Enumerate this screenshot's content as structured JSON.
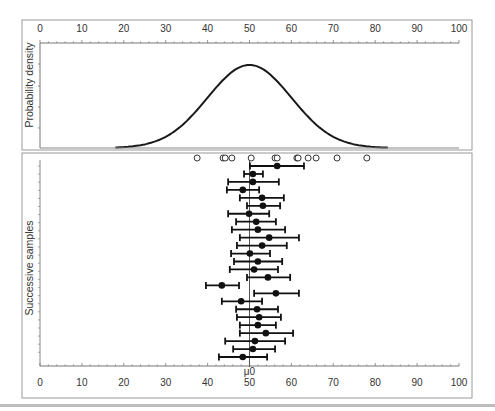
{
  "chart_data": [
    {
      "type": "line",
      "panel": "top",
      "title": "",
      "ylabel": "Probability density",
      "xlabel": "",
      "xlim": [
        0,
        100
      ],
      "x_ticks": [
        0,
        10,
        20,
        30,
        40,
        50,
        60,
        70,
        80,
        90,
        100
      ],
      "x_tick_position": "top",
      "grid": false,
      "distribution": {
        "name": "normal",
        "mean": 50,
        "sd": 10
      },
      "series": [
        {
          "name": "density curve",
          "x": [
            0,
            10,
            20,
            25,
            30,
            35,
            40,
            45,
            50,
            55,
            60,
            65,
            70,
            75,
            80,
            90,
            100
          ],
          "values": [
            0.0,
            0.0,
            0.0004,
            0.0018,
            0.0054,
            0.013,
            0.0242,
            0.0352,
            0.0399,
            0.0352,
            0.0242,
            0.013,
            0.0054,
            0.0018,
            0.0004,
            0.0,
            0.0
          ]
        }
      ]
    },
    {
      "type": "scatter",
      "panel": "bottom",
      "title": "",
      "ylabel": "Successive samples",
      "xlabel": "",
      "xlim": [
        0,
        100
      ],
      "x_ticks": [
        0,
        10,
        20,
        30,
        40,
        50,
        60,
        70,
        80,
        90,
        100
      ],
      "reference_line": {
        "x": 50,
        "label": "μ0"
      },
      "grid": false,
      "legend": "none",
      "single_sample_points": [
        37.5,
        43.7,
        44.2,
        45.8,
        50.4,
        56.1,
        56.6,
        61.3,
        61.6,
        64.0,
        65.9,
        70.9,
        78.0
      ],
      "sample_intervals": [
        {
          "sample": 1,
          "mean": 56.6,
          "lower": 50.1,
          "upper": 63.0
        },
        {
          "sample": 2,
          "mean": 50.8,
          "lower": 48.7,
          "upper": 53.2
        },
        {
          "sample": 3,
          "mean": 50.8,
          "lower": 44.9,
          "upper": 57.0
        },
        {
          "sample": 4,
          "mean": 48.4,
          "lower": 44.6,
          "upper": 52.3
        },
        {
          "sample": 5,
          "mean": 53.0,
          "lower": 47.7,
          "upper": 58.2
        },
        {
          "sample": 6,
          "mean": 53.2,
          "lower": 49.4,
          "upper": 57.3
        },
        {
          "sample": 7,
          "mean": 49.9,
          "lower": 44.9,
          "upper": 54.7
        },
        {
          "sample": 8,
          "mean": 51.6,
          "lower": 46.8,
          "upper": 56.3
        },
        {
          "sample": 9,
          "mean": 52.0,
          "lower": 45.8,
          "upper": 58.5
        },
        {
          "sample": 10,
          "mean": 54.7,
          "lower": 47.7,
          "upper": 61.8
        },
        {
          "sample": 11,
          "mean": 53.0,
          "lower": 47.0,
          "upper": 58.9
        },
        {
          "sample": 12,
          "mean": 50.1,
          "lower": 45.6,
          "upper": 54.9
        },
        {
          "sample": 13,
          "mean": 52.0,
          "lower": 46.3,
          "upper": 57.8
        },
        {
          "sample": 14,
          "mean": 51.1,
          "lower": 45.3,
          "upper": 56.8
        },
        {
          "sample": 15,
          "mean": 54.4,
          "lower": 49.4,
          "upper": 59.7
        },
        {
          "sample": 16,
          "mean": 43.4,
          "lower": 39.6,
          "upper": 47.5
        },
        {
          "sample": 17,
          "mean": 56.3,
          "lower": 51.1,
          "upper": 61.8
        },
        {
          "sample": 18,
          "mean": 48.0,
          "lower": 43.4,
          "upper": 53.0
        },
        {
          "sample": 19,
          "mean": 51.8,
          "lower": 46.8,
          "upper": 56.8
        },
        {
          "sample": 20,
          "mean": 52.3,
          "lower": 47.0,
          "upper": 57.5
        },
        {
          "sample": 21,
          "mean": 52.0,
          "lower": 47.7,
          "upper": 56.3
        },
        {
          "sample": 22,
          "mean": 53.9,
          "lower": 47.7,
          "upper": 60.4
        },
        {
          "sample": 23,
          "mean": 51.3,
          "lower": 44.2,
          "upper": 58.5
        },
        {
          "sample": 24,
          "mean": 50.8,
          "lower": 46.1,
          "upper": 56.1
        },
        {
          "sample": 25,
          "mean": 48.4,
          "lower": 42.7,
          "upper": 54.2
        }
      ]
    }
  ],
  "labels": {
    "top_ylabel": "Probability density",
    "bottom_ylabel": "Successive samples",
    "mu_label": "μ0",
    "top_ticks": [
      "0",
      "10",
      "20",
      "30",
      "40",
      "50",
      "60",
      "70",
      "80",
      "90",
      "100"
    ],
    "bottom_ticks": [
      "0",
      "10",
      "20",
      "30",
      "40",
      "50",
      "60",
      "70",
      "80",
      "90",
      "100"
    ]
  },
  "colors": {
    "curve": "#1a1a1a",
    "frame": "#9a9a9a",
    "text": "#333333",
    "marker": "#111111",
    "reference_line": "#555555"
  }
}
